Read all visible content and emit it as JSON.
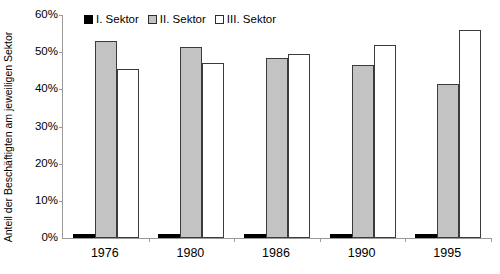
{
  "chart_data": {
    "type": "bar",
    "title": "",
    "xlabel": "",
    "ylabel": "Anteil der Beschäftigten am jeweiligen Sektor",
    "ylim": [
      0,
      60
    ],
    "ytick_labels": [
      "0%",
      "10%",
      "20%",
      "30%",
      "40%",
      "50%",
      "60%"
    ],
    "ytick_values": [
      0,
      10,
      20,
      30,
      40,
      50,
      60
    ],
    "grid": false,
    "legend_position": "top-left-inside",
    "categories": [
      "1976",
      "1980",
      "1986",
      "1990",
      "1995"
    ],
    "series": [
      {
        "name": "I. Sektor",
        "color": "#000000",
        "values": [
          1.0,
          1.0,
          1.0,
          1.0,
          1.0
        ]
      },
      {
        "name": "II. Sektor",
        "color": "#c3c3c3",
        "values": [
          53.0,
          51.5,
          48.5,
          46.5,
          41.5
        ]
      },
      {
        "name": "III. Sektor",
        "color": "#ffffff",
        "values": [
          45.5,
          47.0,
          49.5,
          51.8,
          56.0
        ]
      }
    ]
  },
  "axis": {
    "line_color": "#9a9a9a"
  }
}
